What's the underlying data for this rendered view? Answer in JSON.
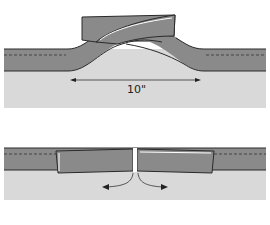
{
  "diagram": {
    "type": "binding-join-illustration",
    "panels": [
      {
        "id": "top",
        "description": "Binding strip ends crossed and overlapped above quilt edge",
        "measurement_label": "10\"",
        "arrow": "double-headed horizontal"
      },
      {
        "id": "bottom",
        "description": "Binding ends trimmed and butted together, seam pressed open",
        "arrows": [
          "left",
          "right"
        ]
      }
    ],
    "colors": {
      "background": "#ffffff",
      "quilt": "#d9d9d9",
      "binding": "#8a8a8a",
      "outline": "#2a2a2a",
      "stitch_line": "#333333"
    }
  }
}
